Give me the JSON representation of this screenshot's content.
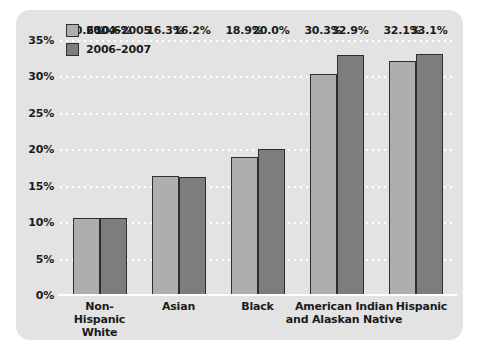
{
  "chart_data": {
    "type": "bar",
    "title": "",
    "subtitle": "",
    "xlabel": "",
    "ylabel": "",
    "ylim": [
      0,
      35
    ],
    "ytick_labels": [
      "35%",
      "30%",
      "25%",
      "20%",
      "15%",
      "10%",
      "5%",
      "0%"
    ],
    "ytick_values": [
      35,
      30,
      25,
      20,
      15,
      10,
      5,
      0
    ],
    "grid": true,
    "legend_position": "top-left",
    "categories": [
      "Non-Hispanic\nWhite",
      "Asian",
      "Black",
      "American Indian\nand Alaskan Native",
      "Hispanic"
    ],
    "category_lines": [
      [
        "Non-Hispanic",
        "White"
      ],
      [
        "Asian"
      ],
      [
        "Black"
      ],
      [
        "American Indian",
        "and Alaskan Native"
      ],
      [
        "Hispanic"
      ]
    ],
    "series": [
      {
        "name": "2004–2005",
        "color": "#aeaeae",
        "values": [
          10.6,
          16.3,
          18.9,
          30.3,
          32.1
        ],
        "labels": [
          "10.6%",
          "16.3%",
          "18.9%",
          "30.3%",
          "32.1%"
        ]
      },
      {
        "name": "2006–2007",
        "color": "#7d7d7d",
        "values": [
          10.6,
          16.2,
          20.0,
          32.9,
          33.1
        ],
        "labels": [
          "10.6%",
          "16.2%",
          "20.0%",
          "32.9%",
          "33.1%"
        ]
      }
    ]
  },
  "legend": {
    "items": [
      {
        "label": "2004–2005",
        "swatch": "light"
      },
      {
        "label": "2006–2007",
        "swatch": "dark"
      }
    ]
  },
  "colors": {
    "panel_background": "#e3e3e3",
    "page_background": "#ffffff",
    "series_1": "#aeaeae",
    "series_2": "#7d7d7d",
    "bar_border": "#2e2e2e",
    "gridline": "#ffffff",
    "text": "#1b1b1b"
  }
}
